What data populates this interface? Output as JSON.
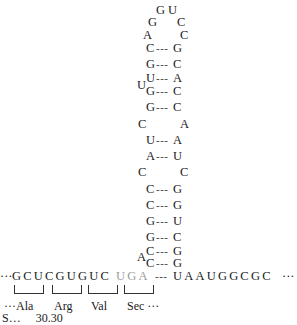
{
  "figure": {
    "loop": [
      {
        "base": "G",
        "x": 156,
        "y": 4
      },
      {
        "base": "U",
        "x": 168,
        "y": 4
      },
      {
        "base": "G",
        "x": 148,
        "y": 16
      },
      {
        "base": "C",
        "x": 177,
        "y": 16
      },
      {
        "base": "A",
        "x": 143,
        "y": 29
      },
      {
        "base": "C",
        "x": 180,
        "y": 29
      }
    ],
    "stem": [
      {
        "left": "C",
        "bond": "---",
        "right": "G",
        "y": 42
      },
      {
        "left": "G",
        "bond": "---",
        "right": "C",
        "y": 59
      },
      {
        "left": "U",
        "bond": "---",
        "right": "A",
        "y": 74
      },
      {
        "left": "G",
        "bond": "---",
        "right": "C",
        "y": 84
      },
      {
        "left": "G",
        "bond": "---",
        "right": "C",
        "y": 101
      },
      {
        "left": "C",
        "bond": "",
        "right": "A",
        "y": 119,
        "unpaired": true
      },
      {
        "left": "U",
        "bond": "---",
        "right": "A",
        "y": 137
      },
      {
        "left": "A",
        "bond": "---",
        "right": "U",
        "y": 155
      },
      {
        "left": "C",
        "bond": "",
        "right": "C",
        "y": 173,
        "unpaired": true
      },
      {
        "left": "C",
        "bond": "---",
        "right": "G",
        "y": 191
      },
      {
        "left": "C",
        "bond": "---",
        "right": "G",
        "y": 209
      },
      {
        "left": "G",
        "bond": "---",
        "right": "U",
        "y": 226
      },
      {
        "left": "G",
        "bond": "---",
        "right": "C",
        "y": 243
      },
      {
        "left": "C",
        "bond": "---",
        "right": "G",
        "y": 255
      },
      {
        "left": "C",
        "bond": "---",
        "right": "G",
        "y": 268
      }
    ],
    "bulges": [
      {
        "base": "U",
        "x": 136,
        "y": 66
      },
      {
        "base": "A",
        "x": 136,
        "y": 236
      }
    ],
    "sequence": {
      "leading": "···",
      "codons_black": "GCUCGUGUC",
      "codon_sec": "UGA",
      "bond": "---",
      "trailing": "UAAUGGCGC",
      "trailing_dots": "···"
    },
    "codon_labels": [
      {
        "label": "···Ala"
      },
      {
        "label": "Arg"
      },
      {
        "label": "Val"
      },
      {
        "label": "Sec ···"
      }
    ],
    "caption_partial": "S…  30.30"
  },
  "colors": {
    "text": "#1a1a1a",
    "sec_codon": "#9a9a9a",
    "background": "#ffffff"
  }
}
